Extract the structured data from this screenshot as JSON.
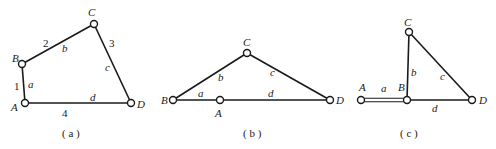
{
  "figure": {
    "panels": [
      {
        "id": "a",
        "caption": "( a )",
        "joints": {
          "A": "A",
          "B": "B",
          "C": "C",
          "D": "D"
        },
        "links": [
          {
            "name": "a",
            "number": "1",
            "from": "A",
            "to": "B"
          },
          {
            "name": "b",
            "number": "2",
            "from": "B",
            "to": "C"
          },
          {
            "name": "c",
            "number": "3",
            "from": "C",
            "to": "D"
          },
          {
            "name": "d",
            "number": "4",
            "from": "A",
            "to": "D"
          }
        ]
      },
      {
        "id": "b",
        "caption": "( b )",
        "joints": {
          "A": "A",
          "B": "B",
          "C": "C",
          "D": "D"
        },
        "links": [
          {
            "name": "a",
            "from": "B",
            "to": "A"
          },
          {
            "name": "b",
            "from": "B",
            "to": "C"
          },
          {
            "name": "c",
            "from": "C",
            "to": "D"
          },
          {
            "name": "d",
            "from": "A",
            "to": "D"
          }
        ]
      },
      {
        "id": "c",
        "caption": "( c )",
        "joints": {
          "A": "A",
          "B": "B",
          "C": "C",
          "D": "D"
        },
        "links": [
          {
            "name": "a",
            "from": "A",
            "to": "B"
          },
          {
            "name": "b",
            "from": "B",
            "to": "C"
          },
          {
            "name": "c",
            "from": "C",
            "to": "D"
          },
          {
            "name": "d",
            "from": "B",
            "to": "D"
          }
        ]
      }
    ]
  }
}
